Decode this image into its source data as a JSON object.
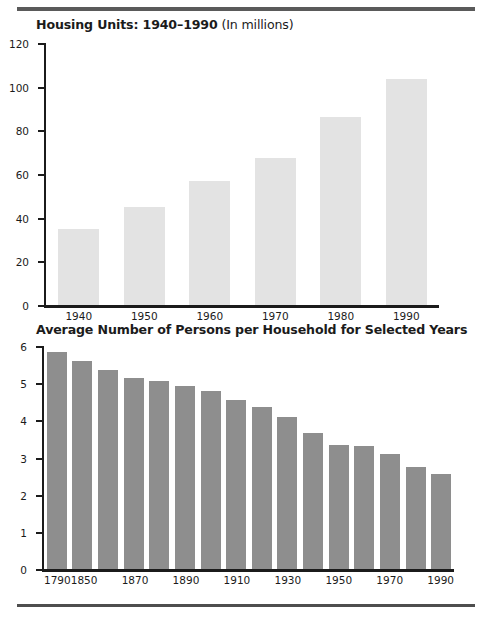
{
  "document": {
    "top_rule_color": "#5a5a5a",
    "bottom_rule_color": "#4e4e4e",
    "background": "#ffffff"
  },
  "chart_data": [
    {
      "id": "housing-units",
      "type": "bar",
      "title_bold": "Housing Units: 1940–1990",
      "title_normal": " (In millions)",
      "title": "Housing Units: 1940–1990 (In millions)",
      "xlabel": "",
      "ylabel": "",
      "ylim": [
        0,
        120
      ],
      "ytick_values": [
        0,
        20,
        40,
        60,
        80,
        100,
        120
      ],
      "ytick_labels": [
        "0",
        "20",
        "40",
        "60",
        "80",
        "100",
        "120"
      ],
      "grid": false,
      "legend": false,
      "bar_color": "#e3e3e3",
      "categories": [
        "1940",
        "1950",
        "1960",
        "1970",
        "1980",
        "1990"
      ],
      "values": [
        35,
        45,
        57,
        67.5,
        86,
        103.5
      ]
    },
    {
      "id": "persons-per-household",
      "type": "bar",
      "title_bold": "Average Number of Persons per Household for Selected Years",
      "title_normal": "",
      "title": "Average Number of Persons per Household for Selected Years",
      "xlabel": "",
      "ylabel": "",
      "ylim": [
        0,
        6
      ],
      "ytick_values": [
        0,
        1,
        2,
        3,
        4,
        5,
        6
      ],
      "ytick_labels": [
        "0",
        "1",
        "2",
        "3",
        "4",
        "5",
        "6"
      ],
      "grid": false,
      "legend": false,
      "bar_color": "#8e8e8e",
      "categories": [
        "1790",
        "1850",
        "1860",
        "1870",
        "1880",
        "1890",
        "1900",
        "1910",
        "1920",
        "1930",
        "1940",
        "1950",
        "1960",
        "1970",
        "1980",
        "1990"
      ],
      "tick_labels": [
        "1790",
        "1850",
        "",
        "1870",
        "",
        "1890",
        "",
        "1910",
        "",
        "1930",
        "",
        "1950",
        "",
        "1970",
        "",
        "1990"
      ],
      "values": [
        5.85,
        5.6,
        5.35,
        5.15,
        5.05,
        4.93,
        4.78,
        4.55,
        4.35,
        4.1,
        3.65,
        3.35,
        3.3,
        3.1,
        2.75,
        2.55
      ]
    }
  ]
}
